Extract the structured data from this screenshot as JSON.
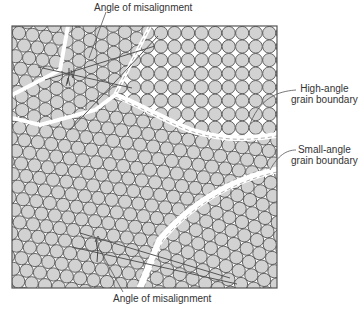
{
  "figure": {
    "frame": {
      "x": 12,
      "y": 26,
      "width": 265,
      "height": 262
    },
    "atom": {
      "radius": 6.6,
      "fill": "#d2d2d2",
      "stroke": "#555555"
    },
    "background": "#ffffff",
    "boundary_fill": "#ffffff"
  },
  "labels": {
    "top": "Angle of misalignment",
    "high_angle_line1": "High-angle",
    "high_angle_line2": "grain boundary",
    "small_angle_line1": "Small-angle",
    "small_angle_line2": "grain boundary",
    "bottom": "Angle of misalignment"
  },
  "grains": [
    {
      "name": "upper-right-square",
      "lattice": "square",
      "angle_deg": 0
    },
    {
      "name": "upper-left-wedge",
      "lattice": "hex",
      "angle_deg": 28
    },
    {
      "name": "middle-main",
      "lattice": "hex",
      "angle_deg": 8
    },
    {
      "name": "lower-right",
      "lattice": "hex",
      "angle_deg": 20
    }
  ]
}
